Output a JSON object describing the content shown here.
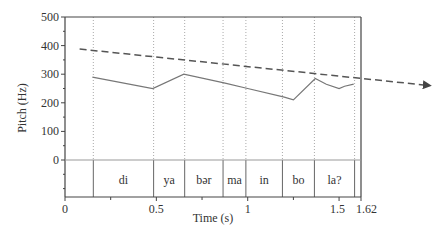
{
  "chart_data": {
    "type": "line",
    "title": "",
    "xlabel": "Time (s)",
    "ylabel": "Pitch (Hz)",
    "xlim": [
      0,
      1.62
    ],
    "ylim": [
      -100,
      500
    ],
    "x_ticks": [
      {
        "value": 0,
        "label": "0"
      },
      {
        "value": 0.5,
        "label": "0.5"
      },
      {
        "value": 1,
        "label": "1"
      },
      {
        "value": 1.5,
        "label": "1.5"
      },
      {
        "value": 1.62,
        "label": "1.62"
      }
    ],
    "x_minor_ticks": [
      0.25,
      0.75,
      1.25
    ],
    "y_ticks": [
      {
        "value": 500,
        "label": "500"
      },
      {
        "value": 400,
        "label": "400"
      },
      {
        "value": 300,
        "label": "300"
      },
      {
        "value": 200,
        "label": "200"
      },
      {
        "value": 100,
        "label": "100"
      },
      {
        "value": 0,
        "label": "0"
      }
    ],
    "y_minor_step": 50,
    "grid": false,
    "series": [
      {
        "name": "pitch contour",
        "style": "solid",
        "color": "#777777",
        "points": [
          [
            0.15,
            290
          ],
          [
            0.48,
            250
          ],
          [
            0.65,
            300
          ],
          [
            0.87,
            270
          ],
          [
            1.0,
            250
          ],
          [
            1.2,
            220
          ],
          [
            1.25,
            210
          ],
          [
            1.37,
            285
          ],
          [
            1.43,
            265
          ],
          [
            1.5,
            250
          ],
          [
            1.53,
            258
          ],
          [
            1.58,
            265
          ]
        ]
      },
      {
        "name": "declination line",
        "style": "dashed-arrow",
        "color": "#555555",
        "points": [
          [
            0.08,
            388
          ],
          [
            2.0,
            260
          ]
        ]
      }
    ],
    "segment_boundaries": [
      0.155,
      0.485,
      0.655,
      0.865,
      0.99,
      1.19,
      1.365,
      1.585
    ],
    "syllables": [
      {
        "label": "di",
        "start": 0.155,
        "end": 0.485
      },
      {
        "label": "ya",
        "start": 0.485,
        "end": 0.655
      },
      {
        "label": "bər",
        "start": 0.655,
        "end": 0.865
      },
      {
        "label": "ma",
        "start": 0.865,
        "end": 0.99
      },
      {
        "label": "in",
        "start": 0.99,
        "end": 1.19
      },
      {
        "label": "bo",
        "start": 1.19,
        "end": 1.365
      },
      {
        "label": "la?",
        "start": 1.365,
        "end": 1.585
      }
    ]
  }
}
